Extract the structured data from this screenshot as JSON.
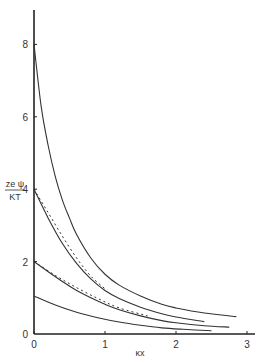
{
  "chart_data": {
    "type": "line",
    "title": "",
    "xlabel": "κx",
    "ylabel": {
      "numerator": "zeψ",
      "denominator": "kT"
    },
    "xlim": [
      0,
      3.1
    ],
    "ylim": [
      0,
      9.2
    ],
    "grid": false,
    "legend": null,
    "x_ticks": [
      0,
      1,
      2,
      3
    ],
    "x_tick_labels": [
      "0",
      "1",
      "2",
      "3"
    ],
    "y_ticks": [
      0,
      2,
      4,
      6,
      8
    ],
    "y_tick_labels": [
      "0",
      "2",
      "4",
      "6",
      "8"
    ],
    "series": [
      {
        "name": "psi0=8 (exact)",
        "style": "solid",
        "x": [
          0,
          0.1,
          0.2,
          0.3,
          0.4,
          0.5,
          0.6,
          0.8,
          1.0,
          1.2,
          1.5,
          1.8,
          2.0,
          2.4,
          2.85
        ],
        "y": [
          8.0,
          6.3,
          5.2,
          4.35,
          3.7,
          3.2,
          2.75,
          2.1,
          1.65,
          1.35,
          1.05,
          0.82,
          0.72,
          0.58,
          0.48
        ]
      },
      {
        "name": "psi0=4 (exact)",
        "style": "solid",
        "x": [
          0,
          0.2,
          0.4,
          0.6,
          0.8,
          1.0,
          1.2,
          1.5,
          1.8,
          2.0,
          2.4
        ],
        "y": [
          4.0,
          3.2,
          2.5,
          1.95,
          1.52,
          1.2,
          0.98,
          0.74,
          0.56,
          0.47,
          0.34
        ]
      },
      {
        "name": "psi0=4 (linear approx)",
        "style": "dashed",
        "x": [
          0,
          0.2,
          0.4,
          0.6,
          0.8,
          1.0
        ],
        "y": [
          4.0,
          3.35,
          2.7,
          2.1,
          1.6,
          1.25
        ]
      },
      {
        "name": "psi0=2 (exact)",
        "style": "solid",
        "x": [
          0,
          0.2,
          0.4,
          0.6,
          0.8,
          1.0,
          1.2,
          1.5,
          1.8,
          2.0,
          2.4,
          2.75
        ],
        "y": [
          2.0,
          1.72,
          1.45,
          1.2,
          1.0,
          0.82,
          0.67,
          0.5,
          0.37,
          0.31,
          0.23,
          0.19
        ]
      },
      {
        "name": "psi0=2 (linear approx)",
        "style": "dashed",
        "x": [
          0,
          0.3,
          0.6,
          0.9,
          1.2,
          1.6
        ],
        "y": [
          2.0,
          1.62,
          1.28,
          0.98,
          0.72,
          0.5
        ]
      },
      {
        "name": "psi0=1 (exact)",
        "style": "solid",
        "x": [
          0,
          0.3,
          0.6,
          0.9,
          1.2,
          1.5,
          1.8,
          2.1,
          2.5
        ],
        "y": [
          1.05,
          0.8,
          0.6,
          0.45,
          0.33,
          0.24,
          0.17,
          0.13,
          0.09
        ]
      }
    ]
  },
  "labels": {
    "ylabel_num": "ze ψ",
    "ylabel_den": "KT",
    "xlabel": "κx"
  }
}
